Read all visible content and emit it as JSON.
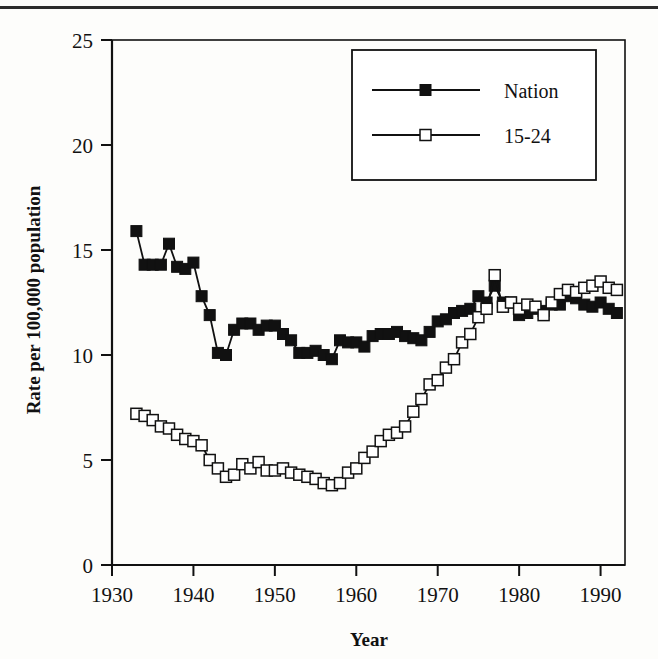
{
  "figure": {
    "background_color": "#fdfdfb",
    "ink_color": "#111111",
    "top_rule": "horizontal-rule"
  },
  "chart_data": {
    "type": "line",
    "title": "",
    "xlabel": "Year",
    "ylabel": "Rate per 100,000 population",
    "xlim": [
      1930,
      1993
    ],
    "ylim": [
      0,
      25
    ],
    "xticks": [
      1930,
      1940,
      1950,
      1960,
      1970,
      1980,
      1990
    ],
    "yticks": [
      0,
      5,
      10,
      15,
      20,
      25
    ],
    "xtick_labels": [
      "1930",
      "1940",
      "1950",
      "1960",
      "1970",
      "1980",
      "1990"
    ],
    "ytick_labels": [
      "0",
      "5",
      "10",
      "15",
      "20",
      "25"
    ],
    "grid": false,
    "legend_position": "top-right-inside",
    "marker_size_px": 11,
    "x": [
      1933,
      1934,
      1935,
      1936,
      1937,
      1938,
      1939,
      1940,
      1941,
      1942,
      1943,
      1944,
      1945,
      1946,
      1947,
      1948,
      1949,
      1950,
      1951,
      1952,
      1953,
      1954,
      1955,
      1956,
      1957,
      1958,
      1959,
      1960,
      1961,
      1962,
      1963,
      1964,
      1965,
      1966,
      1967,
      1968,
      1969,
      1970,
      1971,
      1972,
      1973,
      1974,
      1975,
      1976,
      1977,
      1978,
      1979,
      1980,
      1981,
      1982,
      1983,
      1984,
      1985,
      1986,
      1987,
      1988,
      1989,
      1990,
      1991,
      1992
    ],
    "series": [
      {
        "name": "Nation",
        "marker": "filled-square",
        "color": "#111111",
        "values": [
          15.9,
          14.3,
          14.3,
          14.3,
          15.3,
          14.2,
          14.1,
          14.4,
          12.8,
          11.9,
          10.1,
          10.0,
          11.2,
          11.5,
          11.5,
          11.2,
          11.4,
          11.4,
          11.0,
          10.7,
          10.1,
          10.1,
          10.2,
          10.0,
          9.8,
          10.7,
          10.6,
          10.6,
          10.4,
          10.9,
          11.0,
          11.0,
          11.1,
          10.9,
          10.8,
          10.7,
          11.1,
          11.6,
          11.7,
          12.0,
          12.1,
          12.2,
          12.8,
          12.5,
          13.3,
          12.5,
          12.5,
          11.9,
          12.0,
          12.2,
          12.1,
          12.4,
          12.4,
          12.8,
          12.7,
          12.4,
          12.3,
          12.5,
          12.2,
          12.0
        ]
      },
      {
        "name": "15-24",
        "marker": "open-square",
        "color": "#111111",
        "values": [
          7.2,
          7.1,
          6.9,
          6.6,
          6.5,
          6.2,
          6.0,
          5.9,
          5.7,
          5.0,
          4.6,
          4.2,
          4.3,
          4.8,
          4.6,
          4.9,
          4.5,
          4.5,
          4.6,
          4.4,
          4.3,
          4.2,
          4.1,
          3.9,
          3.8,
          3.9,
          4.4,
          4.6,
          5.1,
          5.4,
          5.9,
          6.2,
          6.3,
          6.6,
          7.3,
          7.9,
          8.6,
          8.8,
          9.4,
          9.8,
          10.6,
          11.0,
          11.8,
          12.2,
          13.8,
          12.3,
          12.5,
          12.2,
          12.4,
          12.3,
          11.9,
          12.5,
          12.9,
          13.1,
          13.0,
          13.2,
          13.3,
          13.5,
          13.2,
          13.1
        ]
      }
    ],
    "legend": [
      {
        "label": "Nation",
        "marker": "filled-square"
      },
      {
        "label": "15-24",
        "marker": "open-square"
      }
    ]
  }
}
